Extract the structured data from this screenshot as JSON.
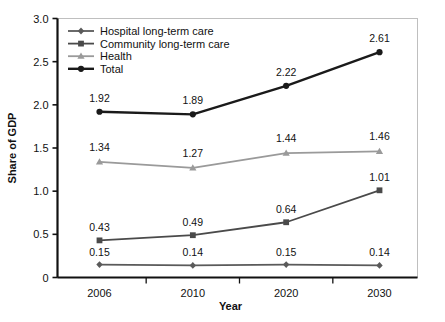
{
  "chart_data": {
    "type": "line",
    "title": "",
    "xlabel": "Year",
    "ylabel": "Share of GDP",
    "categories": [
      "2006",
      "2010",
      "2020",
      "2030"
    ],
    "ylim": [
      0,
      3.0
    ],
    "yticks": [
      "0",
      "0.5",
      "1.0",
      "1.5",
      "2.0",
      "2.5",
      "3.0"
    ],
    "ytick_values": [
      0,
      0.5,
      1.0,
      1.5,
      2.0,
      2.5,
      3.0
    ],
    "grid": false,
    "legend_position": "top-left",
    "series": [
      {
        "name": "Hospital long-term care",
        "marker": "diamond",
        "color": "#5a5a5a",
        "values": [
          0.15,
          0.14,
          0.15,
          0.14
        ],
        "labels": [
          "0.15",
          "0.14",
          "0.15",
          "0.14"
        ]
      },
      {
        "name": "Community long-term care",
        "marker": "square",
        "color": "#4a4a4a",
        "values": [
          0.43,
          0.49,
          0.64,
          1.01
        ],
        "labels": [
          "0.43",
          "0.49",
          "0.64",
          "1.01"
        ]
      },
      {
        "name": "Health",
        "marker": "triangle",
        "color": "#9a9a9a",
        "values": [
          1.34,
          1.27,
          1.44,
          1.46
        ],
        "labels": [
          "1.34",
          "1.27",
          "1.44",
          "1.46"
        ]
      },
      {
        "name": "Total",
        "marker": "circle",
        "color": "#1a1a1a",
        "values": [
          1.92,
          1.89,
          2.22,
          2.61
        ],
        "labels": [
          "1.92",
          "1.89",
          "2.22",
          "2.61"
        ]
      }
    ]
  },
  "axis": {
    "y_title": "Share of GDP",
    "x_title": "Year"
  },
  "legend": {
    "items": [
      {
        "label": "Hospital long-term care"
      },
      {
        "label": "Community long-term care"
      },
      {
        "label": "Health"
      },
      {
        "label": "Total"
      }
    ]
  },
  "ticks": {
    "y": [
      "3.0",
      "2.5",
      "2.0",
      "1.5",
      "1.0",
      "0.5",
      "0"
    ],
    "x": [
      "2006",
      "2010",
      "2020",
      "2030"
    ]
  },
  "colors": {
    "hospital": "#5a5a5a",
    "community": "#4a4a4a",
    "health": "#9a9a9a",
    "total": "#1a1a1a",
    "axis": "#111111",
    "background": "#ffffff"
  }
}
